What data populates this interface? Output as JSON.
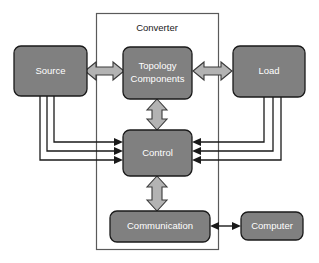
{
  "diagram": {
    "canvas": {
      "width": 319,
      "height": 263,
      "background": "#ffffff"
    },
    "palette": {
      "node_fill": "#808080",
      "node_stroke": "#1a1a1a",
      "node_text": "#ffffff",
      "block_arrow_fill": "#b3b3b3",
      "block_arrow_stroke": "#3a3a3a",
      "line_arrow_stroke": "#1a1a1a",
      "group_stroke": "#5a5a5a",
      "group_text": "#1a1a1a"
    },
    "groups": [
      {
        "id": "converter",
        "label": "Converter",
        "x": 96,
        "y": 13,
        "width": 123,
        "height": 237,
        "label_x": 157,
        "label_y": 28
      }
    ],
    "nodes": [
      {
        "id": "source",
        "label": "Source",
        "lines": [
          "Source"
        ],
        "x": 14,
        "y": 46,
        "width": 73,
        "height": 50,
        "rx": 7
      },
      {
        "id": "topology-components",
        "label": "Topology Components",
        "lines": [
          "Topology",
          "Components"
        ],
        "x": 123,
        "y": 47,
        "width": 69,
        "height": 52,
        "rx": 7
      },
      {
        "id": "load",
        "label": "Load",
        "lines": [
          "Load"
        ],
        "x": 233,
        "y": 46,
        "width": 72,
        "height": 51,
        "rx": 7
      },
      {
        "id": "control",
        "label": "Control",
        "lines": [
          "Control"
        ],
        "x": 123,
        "y": 130,
        "width": 69,
        "height": 46,
        "rx": 7
      },
      {
        "id": "communication",
        "label": "Communication",
        "lines": [
          "Communication"
        ],
        "x": 110,
        "y": 211,
        "width": 100,
        "height": 31,
        "rx": 7
      },
      {
        "id": "computer",
        "label": "Computer",
        "lines": [
          "Computer"
        ],
        "x": 241,
        "y": 212,
        "width": 62,
        "height": 28,
        "rx": 7
      }
    ],
    "block_arrows": [
      {
        "id": "source-to-topology",
        "from": "source",
        "to": "topology-components",
        "orientation": "horizontal",
        "double_headed": true
      },
      {
        "id": "topology-to-load",
        "from": "topology-components",
        "to": "load",
        "orientation": "horizontal",
        "double_headed": true
      },
      {
        "id": "topology-to-control",
        "from": "topology-components",
        "to": "control",
        "orientation": "vertical",
        "double_headed": true
      },
      {
        "id": "control-to-communication",
        "from": "control",
        "to": "communication",
        "orientation": "vertical",
        "double_headed": true
      }
    ],
    "signal_arrows": [
      {
        "id": "source-signal-1",
        "from": "source",
        "to": "control",
        "side": "left"
      },
      {
        "id": "source-signal-2",
        "from": "source",
        "to": "control",
        "side": "left"
      },
      {
        "id": "source-signal-3",
        "from": "source",
        "to": "control",
        "side": "left"
      },
      {
        "id": "load-signal-1",
        "from": "load",
        "to": "control",
        "side": "right"
      },
      {
        "id": "load-signal-2",
        "from": "load",
        "to": "control",
        "side": "right"
      },
      {
        "id": "load-signal-3",
        "from": "load",
        "to": "control",
        "side": "right"
      },
      {
        "id": "communication-computer-link",
        "from": "communication",
        "to": "computer",
        "side": "bottom",
        "double_headed": true
      }
    ]
  }
}
